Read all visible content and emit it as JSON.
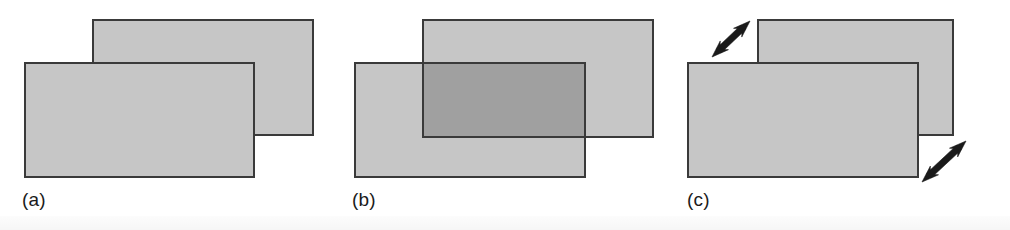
{
  "figure": {
    "width": 1010,
    "height": 230,
    "background_color": "#ffffff"
  },
  "style": {
    "rect_fill": "#c6c6c6",
    "rect_fill_translucent": "#c6c6c6",
    "overlap_fill": "#a0a0a0",
    "rect_stroke": "#3a3a3a",
    "rect_stroke_width": 2,
    "arrow_color": "#1a1a1a",
    "label_color": "#1b1b1b",
    "label_font_size": 19
  },
  "panels": [
    {
      "id": "panel-a",
      "label": "(a)",
      "label_x": 22,
      "label_y": 190,
      "mode": "opaque",
      "rects": [
        {
          "name": "back-rectangle",
          "x": 93,
          "y": 20,
          "width": 220,
          "height": 115,
          "fill": "#c6c6c6",
          "opacity": 1,
          "z": 1
        },
        {
          "name": "front-rectangle",
          "x": 25,
          "y": 63,
          "width": 229,
          "height": 114,
          "fill": "#c6c6c6",
          "opacity": 1,
          "z": 2
        }
      ],
      "arrows": []
    },
    {
      "id": "panel-b",
      "label": "(b)",
      "label_x": 352,
      "label_y": 190,
      "mode": "translucent",
      "rects": [
        {
          "name": "back-rectangle",
          "x": 423,
          "y": 20,
          "width": 230,
          "height": 117,
          "fill": "#c6c6c6",
          "opacity": 1,
          "z": 1
        },
        {
          "name": "front-rectangle",
          "x": 355,
          "y": 63,
          "width": 230,
          "height": 114,
          "fill": "#c6c6c6",
          "opacity": 1,
          "z": 2
        }
      ],
      "overlap": {
        "name": "overlap-region",
        "x": 423,
        "y": 63,
        "width": 162,
        "height": 74,
        "fill": "#a0a0a0"
      },
      "arrows": []
    },
    {
      "id": "panel-c",
      "label": "(c)",
      "label_x": 687,
      "label_y": 190,
      "mode": "exploded",
      "rects": [
        {
          "name": "back-rectangle",
          "x": 758,
          "y": 20,
          "width": 195,
          "height": 115,
          "fill": "#c6c6c6",
          "opacity": 1,
          "z": 1
        },
        {
          "name": "front-rectangle",
          "x": 688,
          "y": 63,
          "width": 230,
          "height": 114,
          "fill": "#c6c6c6",
          "opacity": 1,
          "z": 2
        }
      ],
      "arrows": [
        {
          "name": "separation-arrow-upper-left",
          "x1": 712,
          "y1": 57,
          "x2": 750,
          "y2": 21,
          "double_headed": true
        },
        {
          "name": "separation-arrow-lower-right",
          "x1": 922,
          "y1": 182,
          "x2": 966,
          "y2": 141,
          "double_headed": true
        }
      ]
    }
  ]
}
